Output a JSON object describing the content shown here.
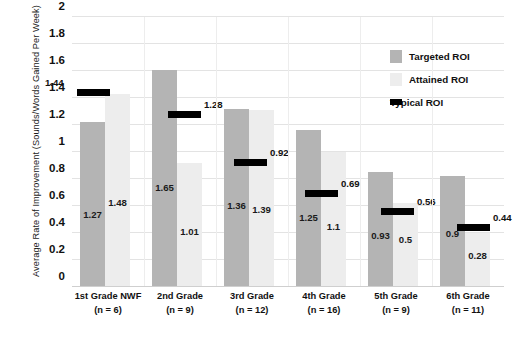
{
  "chart_data": {
    "type": "bar",
    "title": "",
    "subtitle": "",
    "xlabel": "",
    "ylabel": "Average Rate of Improvement (Sounds/Words Gained Per Week)",
    "ylim": [
      0,
      2
    ],
    "ytick_values": [
      0,
      0.2,
      0.4,
      0.6,
      0.8,
      1,
      1.2,
      1.4,
      1.6,
      1.8,
      2
    ],
    "ytick_labels": [
      "0",
      "0.2",
      "0.4",
      "0.6",
      "0.8",
      "1",
      "1.2",
      "1.4",
      "1.6",
      "1.8",
      "2"
    ],
    "grid": true,
    "legend_position": "top-right",
    "categories": [
      "1st Grade NWF",
      "2nd Grade",
      "3rd Grade",
      "4th Grade",
      "5th Grade",
      "6th Grade"
    ],
    "category_sublabels": [
      "(n = 6)",
      "(n = 9)",
      "(n = 12)",
      "(n = 16)",
      "(n = 9)",
      "(n = 11)"
    ],
    "sample_sizes": [
      6,
      9,
      12,
      16,
      9,
      11
    ],
    "series": [
      {
        "name": "Targeted ROI",
        "color": "#b4b4b4",
        "type": "bar",
        "labels": [
          "1.27",
          "1.65",
          "1.36",
          "1.25",
          "0.93",
          "0.9"
        ],
        "values": [
          1.27,
          1.65,
          1.36,
          1.25,
          0.93,
          0.9
        ],
        "bar_heights": [
          1.22,
          1.61,
          1.32,
          1.16,
          0.85,
          0.82
        ]
      },
      {
        "name": "Attained ROI",
        "color": "#ededed",
        "type": "bar",
        "labels": [
          "1.48",
          "1.01",
          "1.39",
          "1.1",
          "0.5",
          "0.28"
        ],
        "values": [
          1.48,
          1.01,
          1.39,
          1.1,
          0.5,
          0.28
        ],
        "bar_heights": [
          1.43,
          0.92,
          1.31,
          1.0,
          0.62,
          0.4
        ]
      },
      {
        "name": "Typical ROI",
        "color": "#000000",
        "type": "marker",
        "labels": [
          "1.44",
          "1.28",
          "0.92",
          "0.69",
          "0.56",
          "0.44"
        ],
        "values": [
          1.44,
          1.28,
          0.92,
          0.69,
          0.56,
          0.44
        ]
      }
    ]
  },
  "legend": {
    "items": [
      {
        "label": "Targeted ROI",
        "swatch": "targeted"
      },
      {
        "label": "Attained ROI",
        "swatch": "attained"
      },
      {
        "label": "Typical ROI",
        "swatch": "typical"
      }
    ]
  },
  "colors": {
    "targeted": "#b4b4b4",
    "attained": "#ededed",
    "typical": "#000000",
    "gridline": "#e3e3e3",
    "text": "#111111",
    "background": "#ffffff"
  }
}
